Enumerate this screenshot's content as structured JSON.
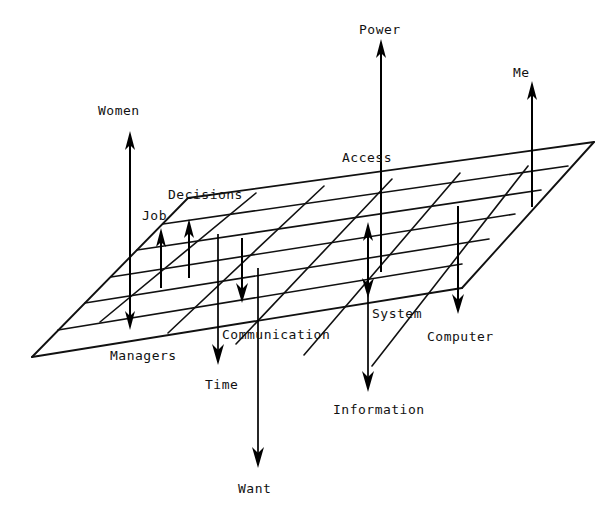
{
  "diagram": {
    "type": "node-arrow-plane-diagram",
    "canvas": {
      "width": 613,
      "height": 512
    },
    "colors": {
      "background": "#ffffff",
      "ink": "#111111",
      "arrow": "#000000"
    },
    "plane": {
      "name": "perspective-grid-plane",
      "corners": {
        "left": [
          32,
          357
        ],
        "top": [
          188,
          198
        ],
        "right": [
          594,
          142
        ],
        "bottom": [
          462,
          288
        ]
      },
      "rows": 5,
      "cols": 6
    },
    "labels": [
      {
        "id": "women",
        "text": "Women",
        "x": 98,
        "y": 104,
        "direction": "up"
      },
      {
        "id": "decisions",
        "text": "Decisions",
        "x": 168,
        "y": 188,
        "direction": "up"
      },
      {
        "id": "job",
        "text": "Job",
        "x": 142,
        "y": 209,
        "direction": "up"
      },
      {
        "id": "power",
        "text": "Power",
        "x": 359,
        "y": 23,
        "direction": "up"
      },
      {
        "id": "access",
        "text": "Access",
        "x": 342,
        "y": 151,
        "direction": "up"
      },
      {
        "id": "me",
        "text": "Me",
        "x": 513,
        "y": 66,
        "direction": "up"
      },
      {
        "id": "managers",
        "text": "Managers",
        "x": 110,
        "y": 349,
        "direction": "down"
      },
      {
        "id": "time",
        "text": "Time",
        "x": 205,
        "y": 378,
        "direction": "down"
      },
      {
        "id": "communication",
        "text": "Communication",
        "x": 222,
        "y": 328,
        "direction": "down"
      },
      {
        "id": "want",
        "text": "Want",
        "x": 238,
        "y": 482,
        "direction": "down"
      },
      {
        "id": "system",
        "text": "System",
        "x": 372,
        "y": 307,
        "direction": "down"
      },
      {
        "id": "information",
        "text": "Information",
        "x": 333,
        "y": 403,
        "direction": "down"
      },
      {
        "id": "computer",
        "text": "Computer",
        "x": 427,
        "y": 330,
        "direction": "down"
      }
    ],
    "arrows": [
      {
        "id": "women-arrow",
        "label": "Women",
        "direction": "up",
        "x": 130,
        "from_y": 307,
        "to_y": 134
      },
      {
        "id": "job-arrow",
        "label": "Job",
        "direction": "up",
        "x": 161,
        "from_y": 288,
        "to_y": 231
      },
      {
        "id": "decisions-arrow",
        "label": "Decisions",
        "direction": "up",
        "x": 189,
        "from_y": 278,
        "to_y": 222
      },
      {
        "id": "power-arrow",
        "label": "Power",
        "direction": "up",
        "x": 381,
        "from_y": 272,
        "to_y": 42
      },
      {
        "id": "access-arrow",
        "label": "Access",
        "direction": "up",
        "x": 368,
        "from_y": 289,
        "to_y": 225
      },
      {
        "id": "me-arrow",
        "label": "Me",
        "direction": "up",
        "x": 532,
        "from_y": 207,
        "to_y": 84
      },
      {
        "id": "managers-arrow",
        "label": "Managers",
        "direction": "down",
        "x": 130,
        "from_y": 274,
        "to_y": 327
      },
      {
        "id": "time-arrow",
        "label": "Time",
        "direction": "down",
        "x": 218,
        "from_y": 234,
        "to_y": 362
      },
      {
        "id": "communication-arrow",
        "label": "Communication",
        "direction": "down",
        "x": 242,
        "from_y": 238,
        "to_y": 302
      },
      {
        "id": "want-arrow",
        "label": "Want",
        "direction": "down",
        "x": 258,
        "from_y": 268,
        "to_y": 465
      },
      {
        "id": "system-arrow",
        "label": "System",
        "direction": "down",
        "x": 368,
        "from_y": 238,
        "to_y": 297
      },
      {
        "id": "information-arrow",
        "label": "Information",
        "direction": "down",
        "x": 368,
        "from_y": 238,
        "to_y": 389
      },
      {
        "id": "computer-arrow",
        "label": "Computer",
        "direction": "down",
        "x": 458,
        "from_y": 206,
        "to_y": 312
      }
    ]
  }
}
